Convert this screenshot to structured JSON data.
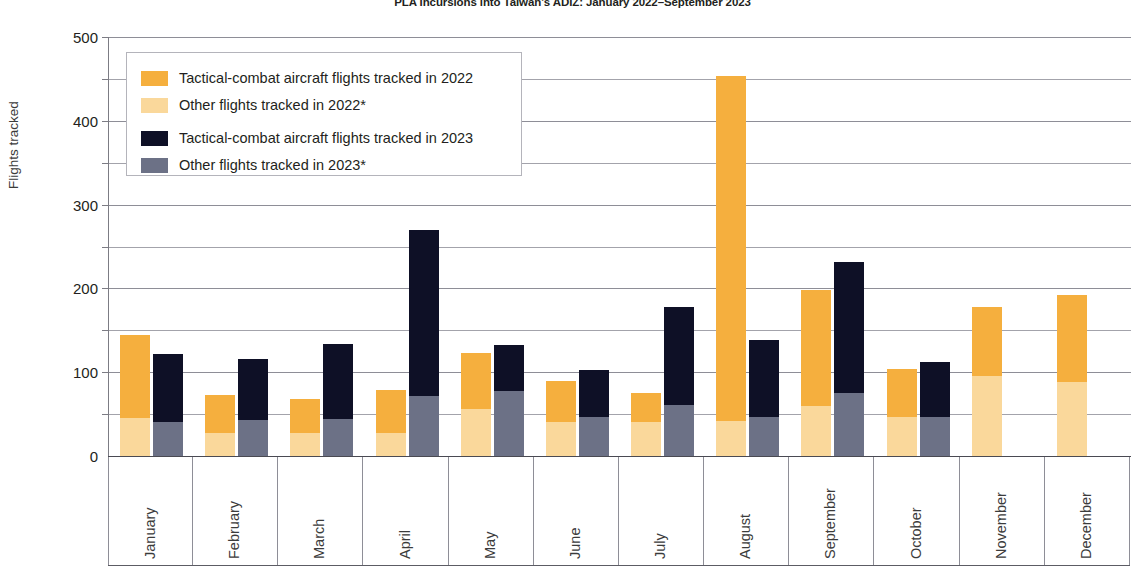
{
  "title": "PLA Incursions into Taiwan's ADIZ: January 2022–September 2023",
  "y_axis_title": "Flights tracked",
  "legend": {
    "items": [
      {
        "key": "t2022",
        "label": "Tactical-combat aircraft flights tracked in 2022",
        "color": "#f5af3e"
      },
      {
        "key": "o2022",
        "label": "Other flights tracked in 2022*",
        "color": "#fad89b"
      },
      {
        "key": "t2023",
        "label": "Tactical-combat aircraft flights tracked in 2023",
        "color": "#0e1026"
      },
      {
        "key": "o2023",
        "label": "Other flights tracked in 2023*",
        "color": "#6c7186"
      }
    ]
  },
  "chart_data": {
    "type": "bar",
    "subtype": "grouped-stacked",
    "title": "PLA Incursions into Taiwan's ADIZ: January 2022–September 2023",
    "xlabel": "",
    "ylabel": "Flights tracked",
    "ylim": [
      0,
      500
    ],
    "ytick_labels": [
      "0",
      "100",
      "200",
      "300",
      "400",
      "500"
    ],
    "ytick_values": [
      0,
      100,
      200,
      300,
      400,
      500
    ],
    "gridline_values": [
      50,
      100,
      150,
      200,
      250,
      300,
      350,
      400,
      450,
      500
    ],
    "grid": true,
    "legend_position": "upper-left-inside",
    "categories": [
      "January",
      "February",
      "March",
      "April",
      "May",
      "June",
      "July",
      "August",
      "September",
      "October",
      "November",
      "December"
    ],
    "series": [
      {
        "name": "Tactical-combat aircraft flights tracked in 2022",
        "key": "t2022",
        "group": "2022",
        "stack_part": "tactical",
        "color": "#f5af3e",
        "values": [
          100,
          46,
          40,
          51,
          67,
          49,
          34,
          412,
          138,
          58,
          82,
          104
        ]
      },
      {
        "name": "Other flights tracked in 2022*",
        "key": "o2022",
        "group": "2022",
        "stack_part": "other",
        "color": "#fad89b",
        "values": [
          45,
          27,
          28,
          28,
          56,
          40,
          41,
          42,
          60,
          46,
          96,
          88
        ]
      },
      {
        "name": "Tactical-combat aircraft flights tracked in 2023",
        "key": "t2023",
        "group": "2023",
        "stack_part": "tactical",
        "color": "#0e1026",
        "values": [
          81,
          73,
          90,
          198,
          55,
          56,
          117,
          91,
          156,
          65,
          null,
          null
        ]
      },
      {
        "name": "Other flights tracked in 2023*",
        "key": "o2023",
        "group": "2023",
        "stack_part": "other",
        "color": "#6c7186",
        "values": [
          41,
          43,
          44,
          72,
          77,
          47,
          61,
          47,
          75,
          47,
          null,
          null
        ]
      }
    ],
    "totals_2022": [
      145,
      73,
      68,
      79,
      123,
      89,
      75,
      454,
      198,
      104,
      178,
      192
    ],
    "totals_2023": [
      122,
      116,
      134,
      270,
      132,
      103,
      178,
      138,
      231,
      112,
      null,
      null
    ]
  }
}
